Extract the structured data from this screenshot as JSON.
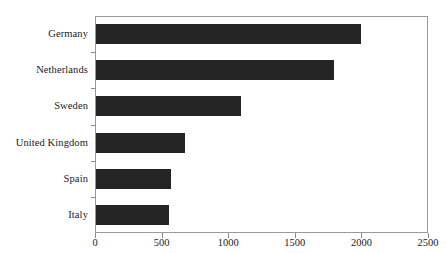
{
  "chart_data": {
    "type": "bar",
    "orientation": "horizontal",
    "title": "",
    "xlabel": "",
    "ylabel": "",
    "categories": [
      "Germany",
      "Netherlands",
      "Sweden",
      "United Kingdom",
      "Spain",
      "Italy"
    ],
    "values": [
      1990,
      1790,
      1090,
      670,
      560,
      545
    ],
    "xlim": [
      0,
      2500
    ],
    "xticks": [
      0,
      500,
      1000,
      1500,
      2000,
      2500
    ],
    "xtick_labels": [
      "0",
      "500",
      "1000",
      "1500",
      "2000",
      "2500"
    ],
    "grid": false,
    "legend": false,
    "bar_color": "#242424",
    "frame_color": "#9a9a9a",
    "background_color": "#ffffff",
    "series": [
      {
        "name": "",
        "values": [
          1990,
          1790,
          1090,
          670,
          560,
          545
        ]
      }
    ]
  },
  "axis": {
    "x_tick_labels": [
      "0",
      "500",
      "1000",
      "1500",
      "2000",
      "2500"
    ],
    "y_tick_labels": [
      "Germany",
      "Netherlands",
      "Sweden",
      "United Kingdom",
      "Spain",
      "Italy"
    ]
  },
  "header": {
    "title_remnant": ""
  }
}
